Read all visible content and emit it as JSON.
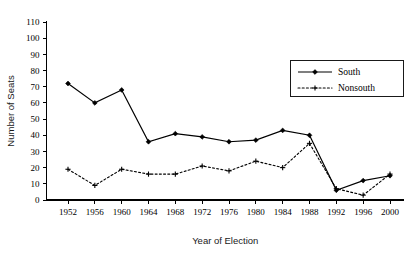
{
  "chart_data": {
    "type": "line",
    "title": "",
    "xlabel": "Year of Election",
    "ylabel": "Number of Seats",
    "categories": [
      1952,
      1956,
      1960,
      1964,
      1968,
      1972,
      1976,
      1980,
      1984,
      1988,
      1992,
      1996,
      2000
    ],
    "x_tick_labels": [
      "1952",
      "1956",
      "1960",
      "1964",
      "1968",
      "1972",
      "1976",
      "1980",
      "1984",
      "1988",
      "1992",
      "1996",
      "2000"
    ],
    "y_tick_labels": [
      "0",
      "10",
      "20",
      "30",
      "40",
      "50",
      "60",
      "70",
      "80",
      "90",
      "100",
      "110"
    ],
    "y_ticks": [
      0,
      10,
      20,
      30,
      40,
      50,
      60,
      70,
      80,
      90,
      100,
      110
    ],
    "ylim": [
      0,
      110
    ],
    "grid": false,
    "legend_position": "upper-right",
    "series": [
      {
        "name": "South",
        "marker": "filled-diamond",
        "linestyle": "solid",
        "color": "#000000",
        "values": [
          72,
          60,
          68,
          36,
          41,
          39,
          36,
          37,
          43,
          40,
          6,
          12,
          15
        ]
      },
      {
        "name": "Nonsouth",
        "marker": "plus",
        "linestyle": "dotted",
        "color": "#000000",
        "values": [
          19,
          9,
          19,
          16,
          16,
          21,
          18,
          24,
          20,
          35,
          7,
          3,
          16
        ]
      }
    ]
  },
  "legend": {
    "entries": [
      {
        "label": "South"
      },
      {
        "label": "Nonsouth"
      }
    ]
  },
  "axes": {
    "y_title": "Number of Seats",
    "x_title": "Year of Election"
  }
}
